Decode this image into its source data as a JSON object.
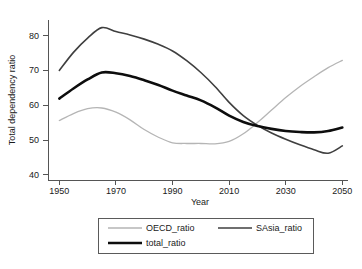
{
  "chart_data": {
    "type": "line",
    "title": "",
    "xlabel": "Year",
    "ylabel": "Total dependency ratio",
    "xlim": [
      1946,
      2052
    ],
    "ylim": [
      38.5,
      84.5
    ],
    "xticks": [
      1950,
      1970,
      1990,
      2010,
      2030,
      2050
    ],
    "xtick_labels": [
      "1950",
      "1970",
      "1990",
      "2010",
      "2030",
      "2050"
    ],
    "yticks": [
      40,
      50,
      60,
      70,
      80
    ],
    "ytick_labels": [
      "40",
      "50",
      "60",
      "70",
      "80"
    ],
    "grid": false,
    "legend_position": "bottom-center",
    "x": [
      1950,
      1955,
      1960,
      1965,
      1970,
      1975,
      1980,
      1985,
      1990,
      1995,
      2000,
      2005,
      2010,
      2015,
      2020,
      2025,
      2030,
      2035,
      2040,
      2045,
      2050
    ],
    "series": [
      {
        "name": "OECD_ratio",
        "color": "#b5b5b5",
        "width": 1.3,
        "values": [
          55.6,
          57.6,
          59.0,
          59.2,
          58.0,
          55.8,
          53.0,
          50.8,
          49.2,
          49.0,
          49.0,
          48.9,
          49.6,
          51.8,
          55.0,
          58.6,
          62.2,
          65.4,
          68.2,
          70.8,
          72.9
        ]
      },
      {
        "name": "SAsia_ratio",
        "color": "#3f3f3f",
        "width": 1.6,
        "values": [
          70.0,
          75.2,
          79.3,
          82.3,
          81.2,
          80.2,
          79.0,
          77.5,
          75.6,
          72.8,
          69.4,
          65.4,
          60.8,
          57.0,
          54.2,
          52.0,
          50.2,
          48.6,
          47.2,
          46.2,
          48.3
        ]
      },
      {
        "name": "total_ratio",
        "color": "#0d0d0d",
        "width": 2.6,
        "values": [
          61.9,
          64.8,
          67.4,
          69.4,
          69.2,
          68.4,
          67.2,
          65.8,
          64.2,
          62.8,
          61.4,
          59.4,
          57.0,
          55.2,
          54.0,
          53.2,
          52.6,
          52.3,
          52.2,
          52.6,
          53.6
        ]
      }
    ],
    "legend_entries": [
      {
        "label": "OECD_ratio",
        "color": "#b5b5b5",
        "width": 1.3
      },
      {
        "label": "SAsia_ratio",
        "color": "#3f3f3f",
        "width": 1.6
      },
      {
        "label": "total_ratio",
        "color": "#0d0d0d",
        "width": 2.6
      }
    ]
  }
}
